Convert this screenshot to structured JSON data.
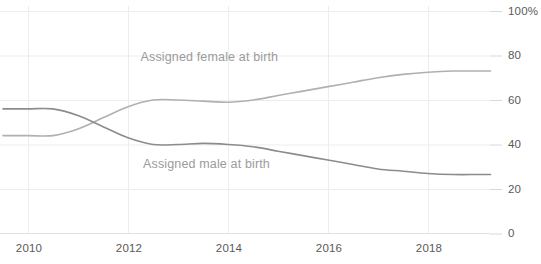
{
  "chart_data": {
    "type": "line",
    "title": "",
    "xlabel": "",
    "ylabel": "",
    "xlim": [
      2009.5,
      2019.25
    ],
    "ylim": [
      0,
      100
    ],
    "grid": "vertical-and-horizontal-light",
    "legend_position": "inline-annotation",
    "x_tick_labels": [
      "2010",
      "2012",
      "2014",
      "2016",
      "2018"
    ],
    "x_tick_values": [
      2010,
      2012,
      2014,
      2016,
      2018
    ],
    "y_tick_labels": [
      "0",
      "20",
      "40",
      "60",
      "80",
      "100%"
    ],
    "y_tick_values": [
      0,
      20,
      40,
      60,
      80,
      100
    ],
    "series": [
      {
        "name": "Assigned female at birth",
        "color": "#b0b0b0",
        "label_x": 2012.25,
        "label_y": 79,
        "x": [
          2009.5,
          2010.0,
          2010.5,
          2011.0,
          2011.5,
          2012.0,
          2012.5,
          2013.0,
          2013.5,
          2014.0,
          2014.5,
          2015.0,
          2015.5,
          2016.0,
          2016.5,
          2017.0,
          2017.5,
          2018.0,
          2018.5,
          2019.0,
          2019.25
        ],
        "values": [
          44,
          44,
          44,
          47,
          52,
          57,
          60,
          60,
          59.5,
          59,
          60,
          62,
          64,
          66,
          68,
          70,
          71.5,
          72.5,
          73,
          73,
          73
        ]
      },
      {
        "name": "Assigned male at birth",
        "color": "#8c8c8c",
        "label_x": 2012.3,
        "label_y": 31,
        "x": [
          2009.5,
          2010.0,
          2010.5,
          2011.0,
          2011.5,
          2012.0,
          2012.5,
          2013.0,
          2013.5,
          2014.0,
          2014.5,
          2015.0,
          2015.5,
          2016.0,
          2016.5,
          2017.0,
          2017.5,
          2018.0,
          2018.5,
          2019.0,
          2019.25
        ],
        "values": [
          56,
          56,
          56,
          53,
          48,
          43,
          40,
          40,
          40.5,
          40,
          39,
          37,
          35,
          33,
          31,
          29,
          28,
          27,
          26.5,
          26.5,
          26.5
        ]
      }
    ]
  },
  "axis": {
    "y_axis_line_color": "#d8d8d8",
    "grid_color": "#ededed",
    "tick_text_color": "#5a5a5a"
  }
}
